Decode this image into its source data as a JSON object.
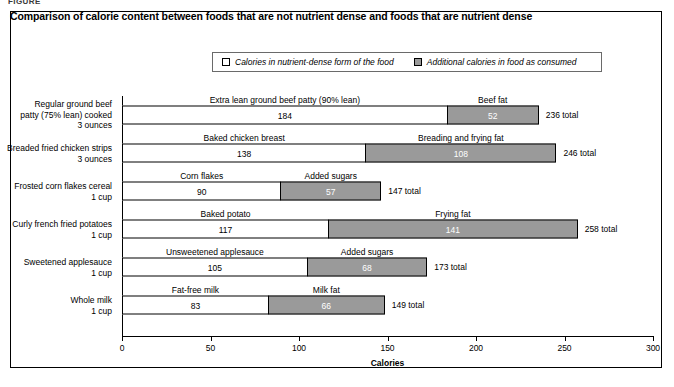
{
  "figure_label": "FIGURE",
  "chart_title": "Comparison of calorie content between foods that are not nutrient dense and foods that are nutrient dense",
  "legend": {
    "items": [
      {
        "swatch": "white",
        "label": "Calories in nutrient-dense form of the food"
      },
      {
        "swatch": "gray",
        "label": "Additional calories in food as consumed"
      }
    ]
  },
  "colors": {
    "nutrient_dense": "#ffffff",
    "additional": "#9a9a9a",
    "outline": "#000000"
  },
  "chart_data": {
    "type": "bar",
    "orientation": "horizontal",
    "stacked": true,
    "title": "Comparison of calorie content between foods that are not nutrient dense and foods that are nutrient dense",
    "xlabel": "Calories",
    "ylabel": "",
    "xlim": [
      0,
      300
    ],
    "xticks": [
      0,
      50,
      100,
      150,
      200,
      250,
      300
    ],
    "grid": false,
    "legend_position": "top-center",
    "categories": [
      "Regular ground beef patty (75% lean) cooked 3 ounces",
      "Breaded fried chicken strips 3 ounces",
      "Frosted corn flakes cereal 1 cup",
      "Curly french fried potatoes 1 cup",
      "Sweetened applesauce 1 cup",
      "Whole milk 1 cup"
    ],
    "series": [
      {
        "name": "Calories in nutrient-dense form of the food",
        "values": [
          184,
          138,
          90,
          117,
          105,
          83
        ]
      },
      {
        "name": "Additional calories in food as consumed",
        "values": [
          52,
          108,
          57,
          141,
          68,
          66
        ]
      }
    ],
    "totals": [
      236,
      246,
      147,
      258,
      173,
      149
    ]
  },
  "rows": [
    {
      "category_lines": [
        "Regular ground beef",
        "patty (75% lean) cooked",
        "3 ounces"
      ],
      "base_label": "Extra lean ground beef patty (90% lean)",
      "base_value": "184",
      "extra_label": "Beef fat",
      "extra_value": "52",
      "total_label": "236 total"
    },
    {
      "category_lines": [
        "Breaded fried chicken strips",
        "3 ounces"
      ],
      "base_label": "Baked chicken breast",
      "base_value": "138",
      "extra_label": "Breading and frying fat",
      "extra_value": "108",
      "total_label": "246 total"
    },
    {
      "category_lines": [
        "Frosted corn flakes cereal",
        "1 cup"
      ],
      "base_label": "Corn flakes",
      "base_value": "90",
      "extra_label": "Added sugars",
      "extra_value": "57",
      "total_label": "147 total"
    },
    {
      "category_lines": [
        "Curly french fried potatoes",
        "1 cup"
      ],
      "base_label": "Baked potato",
      "base_value": "117",
      "extra_label": "Frying fat",
      "extra_value": "141",
      "total_label": "258 total"
    },
    {
      "category_lines": [
        "Sweetened applesauce",
        "1 cup"
      ],
      "base_label": "Unsweetened applesauce",
      "base_value": "105",
      "extra_label": "Added sugars",
      "extra_value": "68",
      "total_label": "173 total"
    },
    {
      "category_lines": [
        "Whole milk",
        "1 cup"
      ],
      "base_label": "Fat-free milk",
      "base_value": "83",
      "extra_label": "Milk fat",
      "extra_value": "66",
      "total_label": "149 total"
    }
  ],
  "axis": {
    "title": "Calories",
    "ticks": [
      "0",
      "50",
      "100",
      "150",
      "200",
      "250",
      "300"
    ]
  }
}
